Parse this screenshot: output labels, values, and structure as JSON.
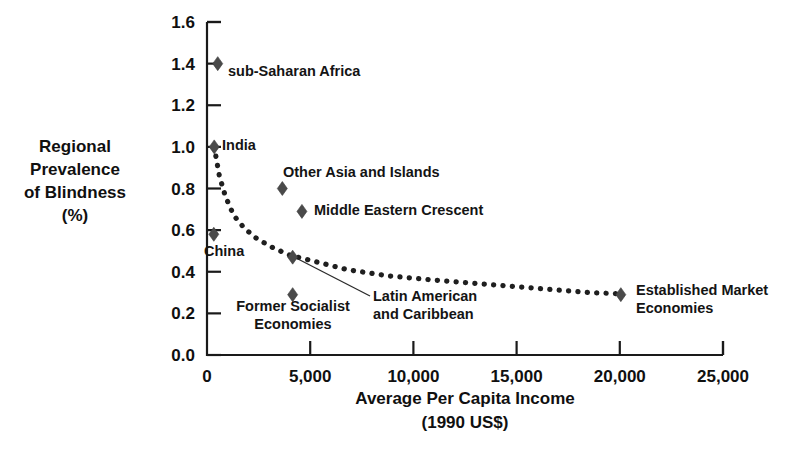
{
  "chart_data": {
    "type": "scatter",
    "title": "",
    "xlabel": "Average Per Capita Income",
    "xlabel_sub": "(1990 US$)",
    "ylabel_lines": [
      "Regional",
      "Prevalence",
      "of Blindness",
      "(%)"
    ],
    "xlim": [
      0,
      25000
    ],
    "ylim": [
      0.0,
      1.6
    ],
    "grid": false,
    "legend": "none",
    "xticks": [
      0,
      5000,
      10000,
      15000,
      20000,
      25000
    ],
    "xtick_labels": [
      "0",
      "5,000",
      "10,000",
      "15,000",
      "20,000",
      "25,000"
    ],
    "yticks": [
      0.0,
      0.2,
      0.4,
      0.6,
      0.8,
      1.0,
      1.2,
      1.4,
      1.6
    ],
    "ytick_labels": [
      "0.0",
      "0.2",
      "0.4",
      "0.6",
      "0.8",
      "1.0",
      "1.2",
      "1.4",
      "1.6"
    ],
    "points": [
      {
        "label": "sub-Saharan Africa",
        "x": 520,
        "y": 1.4
      },
      {
        "label": "India",
        "x": 350,
        "y": 1.0
      },
      {
        "label": "China",
        "x": 330,
        "y": 0.58
      },
      {
        "label": "Other Asia and Islands",
        "x": 3650,
        "y": 0.8
      },
      {
        "label": "Middle Eastern Crescent",
        "x": 4600,
        "y": 0.69
      },
      {
        "label": "Latin American and Caribbean",
        "x": 4150,
        "y": 0.47
      },
      {
        "label": "Former Socialist Economies",
        "x": 4150,
        "y": 0.29
      },
      {
        "label": "Established Market Economies",
        "x": 20050,
        "y": 0.29
      }
    ],
    "trend_curve": {
      "style": "dotted",
      "description": "fitted inverse relationship between income and blindness prevalence",
      "x": [
        350,
        600,
        900,
        1300,
        1800,
        2400,
        3100,
        4000,
        5200,
        6800,
        8800,
        11000,
        13500,
        16000,
        18500,
        19800
      ],
      "y": [
        1.0,
        0.86,
        0.76,
        0.67,
        0.61,
        0.56,
        0.52,
        0.48,
        0.45,
        0.41,
        0.38,
        0.36,
        0.34,
        0.32,
        0.3,
        0.295
      ]
    },
    "annotations": [
      {
        "name": "latin-america-leader-line",
        "from_point": "Latin American and Caribbean",
        "to_label": "Latin American and Caribbean"
      }
    ],
    "point_labels": {
      "sub_saharan_africa": "sub-Saharan Africa",
      "india": "India",
      "china": "China",
      "other_asia": "Other Asia and Islands",
      "middle_eastern_crescent": "Middle Eastern Crescent",
      "latin_american_1": "Latin American",
      "latin_american_2": "and Caribbean",
      "former_socialist_1": "Former Socialist",
      "former_socialist_2": "Economies",
      "established_market_1": "Established Market",
      "established_market_2": "Economies"
    }
  },
  "colors": {
    "background": "#ffffff",
    "axis": "#1a1a1a",
    "marker": "#4a4a4a",
    "text": "#101010",
    "curve": "#1f1f1f"
  }
}
